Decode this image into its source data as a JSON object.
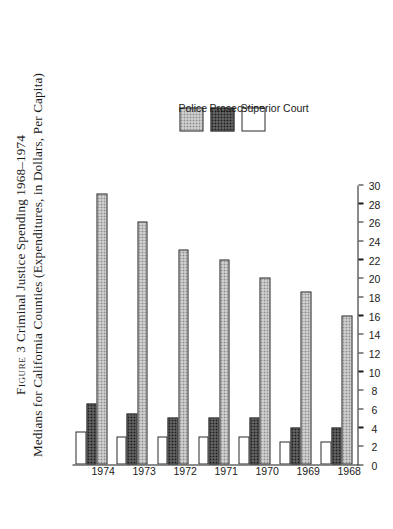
{
  "figure": {
    "title_line1": "Figure 3 Criminal Justice Spending 1968–1974",
    "title_line2": "Medians for California Counties (Expenditures, in Dollars, Per Capita)",
    "figure_word": "Figure 3",
    "title_rest": " Criminal Justice Spending 1968–1974"
  },
  "legend": {
    "items": [
      {
        "label": "Police",
        "swatch": "light-stipple",
        "color": "#e3e3e3"
      },
      {
        "label": "Prosecution",
        "swatch": "dark-checker",
        "color": "#777777"
      },
      {
        "label": "Superior Court",
        "swatch": "white-blank",
        "color": "#ffffff"
      }
    ]
  },
  "chart_data": {
    "type": "bar",
    "orientation": "vertical",
    "xlabel": "",
    "ylabel": "",
    "categories": [
      "1968",
      "1969",
      "1970",
      "1971",
      "1972",
      "1973",
      "1974"
    ],
    "series": [
      {
        "name": "Police",
        "values": [
          16.0,
          18.5,
          20.0,
          22.0,
          23.0,
          26.0,
          29.0
        ]
      },
      {
        "name": "Prosecution",
        "values": [
          4.0,
          4.0,
          5.0,
          5.0,
          5.0,
          5.5,
          6.5
        ]
      },
      {
        "name": "Superior Court",
        "values": [
          2.5,
          2.5,
          3.0,
          3.0,
          3.0,
          3.0,
          3.5
        ]
      }
    ],
    "ylim": [
      0,
      30
    ],
    "yticks": [
      0,
      2,
      4,
      6,
      8,
      10,
      12,
      14,
      16,
      18,
      20,
      22,
      24,
      26,
      28,
      30
    ],
    "ytick_labels": [
      "0",
      "2",
      "4",
      "6",
      "8",
      "10",
      "12",
      "14",
      "16",
      "18",
      "20",
      "22",
      "24",
      "26",
      "28",
      "30"
    ],
    "grid": false,
    "legend_position": "bottom-right"
  }
}
